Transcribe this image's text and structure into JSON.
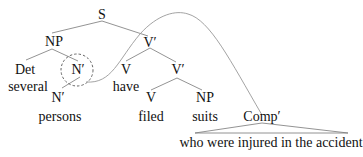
{
  "tree": {
    "nodes": {
      "S": "S",
      "NP_subject": "NP",
      "Det": "Det",
      "Det_word": "several",
      "N_bar_circled": "N′",
      "N_bar_lower": "N′",
      "N_word": "persons",
      "V_bar_top": "V′",
      "V_have": "V",
      "V_have_word": "have",
      "V_bar_lower": "V′",
      "V_filed": "V",
      "V_filed_word": "filed",
      "NP_object": "NP",
      "NP_object_word": "suits",
      "Comp_bar": "Comp′",
      "Comp_bar_yield": "who were injured in the accident"
    },
    "annotations": {
      "circled_node": "N′",
      "circle_style": "dashed",
      "arc": "curved line from circled N′ to Comp′"
    },
    "colors": {
      "text": "#111111",
      "branch": "#777777",
      "arc": "#999999"
    }
  }
}
